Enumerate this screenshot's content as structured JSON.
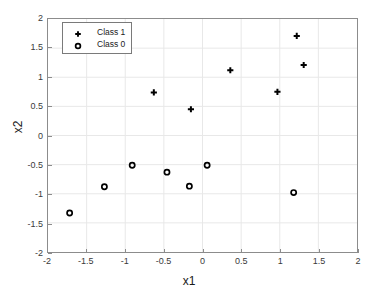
{
  "chart_data": {
    "type": "scatter",
    "title": "",
    "xlabel": "x1",
    "ylabel": "x2",
    "xlim": [
      -2,
      2
    ],
    "ylim": [
      -2,
      2
    ],
    "grid": true,
    "legend_position": "top-left",
    "xticks": [
      "-2",
      "-1.5",
      "-1",
      "-0.5",
      "0",
      "0.5",
      "1",
      "1.5",
      "2"
    ],
    "xtick_values": [
      -2,
      -1.5,
      -1,
      -0.5,
      0,
      0.5,
      1,
      1.5,
      2
    ],
    "yticks": [
      "-2",
      "-1.5",
      "-1",
      "-0.5",
      "0",
      "0.5",
      "1",
      "1.5",
      "2"
    ],
    "ytick_values": [
      -2,
      -1.5,
      -1,
      -0.5,
      0,
      0.5,
      1,
      1.5,
      2
    ],
    "series": [
      {
        "name": "Class 1",
        "marker": "plus",
        "color": "#000000",
        "points": [
          [
            -0.63,
            0.74
          ],
          [
            -0.15,
            0.45
          ],
          [
            0.36,
            1.12
          ],
          [
            0.97,
            0.75
          ],
          [
            1.22,
            1.71
          ],
          [
            1.31,
            1.21
          ]
        ]
      },
      {
        "name": "Class 0",
        "marker": "circle",
        "color": "#000000",
        "points": [
          [
            -1.72,
            -1.33
          ],
          [
            -1.27,
            -0.88
          ],
          [
            -0.91,
            -0.51
          ],
          [
            -0.46,
            -0.63
          ],
          [
            -0.17,
            -0.87
          ],
          [
            0.06,
            -0.51
          ],
          [
            1.18,
            -0.98
          ]
        ]
      }
    ]
  },
  "legend": {
    "entries": [
      {
        "label": "Class 1",
        "marker": "plus-marker-icon"
      },
      {
        "label": "Class 0",
        "marker": "circle-marker-icon"
      }
    ]
  },
  "axes": {
    "x_title": "x1",
    "y_title": "x2"
  },
  "colors": {
    "marker": "#000000",
    "grid": "#e8e8e8",
    "axis": "#8c8c8c",
    "text": "#1a1a1a",
    "background": "#ffffff"
  }
}
